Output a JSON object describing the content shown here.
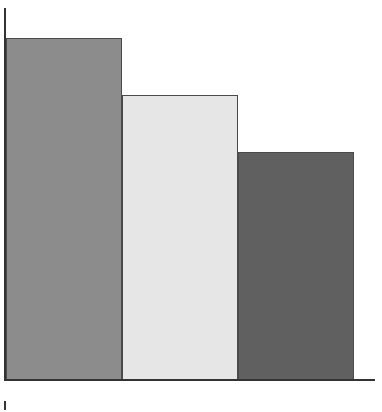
{
  "chart_data": {
    "type": "bar",
    "title": "",
    "xlabel": "",
    "ylabel": "",
    "categories": [
      "",
      "",
      ""
    ],
    "values": [
      6,
      5,
      4
    ],
    "colors": [
      "#8c8c8c",
      "#e6e6e6",
      "#606060"
    ],
    "ylim": [
      0,
      6.6
    ],
    "grid": false,
    "legend": null,
    "tick_labels_visible": false
  },
  "layout": {
    "plot_left": 6,
    "plot_bottom": 380,
    "plot_height_px_per_unit": 57,
    "bar_width": 116,
    "bar_gap": 0
  }
}
